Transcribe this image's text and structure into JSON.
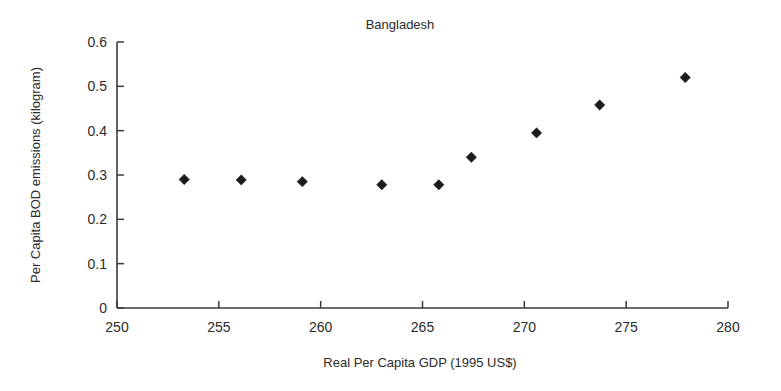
{
  "chart_data": {
    "type": "scatter",
    "title": "Bangladesh",
    "xlabel": "Real Per Capita GDP (1995 US$)",
    "ylabel": "Per Capita BOD emissions (kilogram)",
    "xlim": [
      250,
      280
    ],
    "ylim": [
      0,
      0.6
    ],
    "xticks": [
      250,
      255,
      260,
      265,
      270,
      275,
      280
    ],
    "xtick_labels": [
      "250",
      "255",
      "260",
      "265",
      "270",
      "275",
      "280"
    ],
    "yticks": [
      0,
      0.1,
      0.2,
      0.3,
      0.4,
      0.5,
      0.6
    ],
    "ytick_labels": [
      "0",
      "0.1",
      "0.2",
      "0.3",
      "0.4",
      "0.5",
      "0.6"
    ],
    "grid": false,
    "legend": false,
    "marker": "diamond",
    "marker_color": "#1c1c1c",
    "series": [
      {
        "name": "Per Capita BOD emissions",
        "points": [
          {
            "x": 253.3,
            "y": 0.29
          },
          {
            "x": 256.1,
            "y": 0.289
          },
          {
            "x": 259.1,
            "y": 0.285
          },
          {
            "x": 263.0,
            "y": 0.278
          },
          {
            "x": 265.8,
            "y": 0.278
          },
          {
            "x": 267.4,
            "y": 0.34
          },
          {
            "x": 270.6,
            "y": 0.395
          },
          {
            "x": 273.7,
            "y": 0.458
          },
          {
            "x": 277.9,
            "y": 0.52
          }
        ]
      }
    ]
  }
}
